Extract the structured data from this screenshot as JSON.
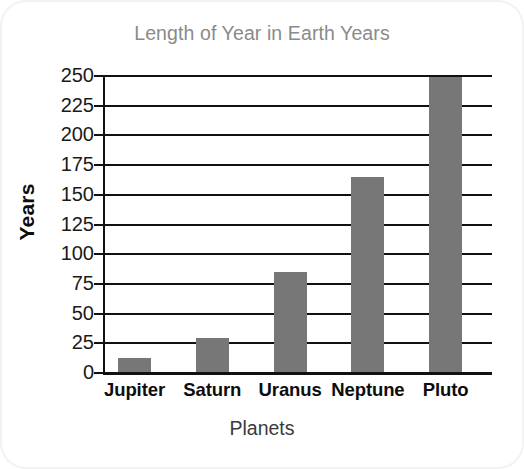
{
  "card": {
    "background": "#ffffff",
    "border_radius_px": 26
  },
  "chart_data": {
    "type": "bar",
    "title": "Length of Year in Earth Years",
    "xlabel": "Planets",
    "ylabel": "Years",
    "categories": [
      "Jupiter",
      "Saturn",
      "Uranus",
      "Neptune",
      "Pluto"
    ],
    "values": [
      12,
      29,
      84,
      164,
      248
    ],
    "ylim": [
      0,
      250
    ],
    "yticks": [
      0,
      25,
      50,
      75,
      100,
      125,
      150,
      175,
      200,
      225,
      250
    ],
    "ytick_labels": [
      "0",
      "25",
      "50",
      "75",
      "100",
      "125",
      "150",
      "175",
      "200",
      "225",
      "250"
    ],
    "grid": true,
    "grid_axis": "y",
    "legend": false,
    "bar_color": "#777777",
    "grid_color": "#111111",
    "title_color": "#8a8a8a",
    "tick_label_color": "#1a1a1a",
    "axis_title_color": "#0d0d0d"
  }
}
